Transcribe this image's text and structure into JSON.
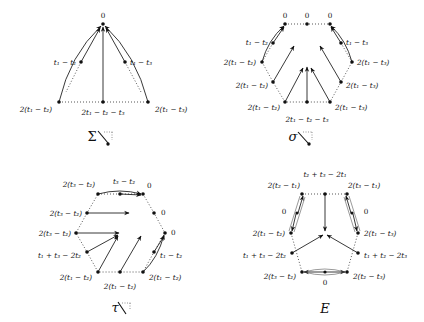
{
  "panels": [
    {
      "id": "sigma-hook",
      "caption": "Σ",
      "labels": {
        "apex": "0",
        "upper_left": "t₁ − t₂",
        "upper_right": "t₁ − t₃",
        "bottom_left": "2(t₁ − t₂)",
        "bottom_mid": "2t₁ − t₂ − t₃",
        "bottom_right": "2(t₁ − t₃)"
      }
    },
    {
      "id": "sigma-small-hook",
      "caption": "σ",
      "labels": {
        "top_left": "0",
        "top_mid": "0",
        "top_right": "0",
        "upper_left": "t₁ − t₂",
        "upper_right": "t₁ − t₃",
        "mid_left": "2(t₁ − t₂)",
        "mid_right": "2(t₁ − t₃)",
        "lower_left": "2(t₁ − t₂)",
        "lower_right": "2(t₁ − t₃)",
        "bottom_left": "2(t₁ − t₂)",
        "bottom_right": "2(t₁ − t₃)",
        "bottom_mid": "2t₁ − t₂ − t₃"
      }
    },
    {
      "id": "tau-hook",
      "caption": "τ",
      "labels": {
        "top_left": "2(t₃ − t₂)",
        "top_mid": "t₃ − t₂",
        "top_right": "0",
        "upper_left": "2(t₃ − t₂)",
        "upper_right": "0",
        "mid_left": "2(t₃ − t₂)",
        "mid_right": "0",
        "lower_left": "t₁ + t₃ − 2t₂",
        "lower_right": "t₁ − t₂",
        "bottom_left": "2(t₁ − t₂)",
        "bottom_mid": "2(t₁ − t₂)",
        "bottom_right": "2(t₁ − t₂)"
      }
    },
    {
      "id": "E",
      "caption": "E",
      "labels": {
        "top_mid": "t₂ + t₃ − 2t₁",
        "top_left": "2(t₂ − t₁)",
        "top_right": "2(t₃ − t₁)",
        "left_zero": "0",
        "right_zero": "0",
        "mid_left": "2(t₁ − t₂)",
        "mid_right": "2(t₁ − t₃)",
        "lower_left": "t₁ + t₃ − 2t₂",
        "lower_right": "t₁ + t₂ − 2t₃",
        "bottom_left": "2(t₃ − t₂)",
        "bottom_right": "2(t₂ − t₃)",
        "bottom_zero": "0"
      }
    }
  ]
}
